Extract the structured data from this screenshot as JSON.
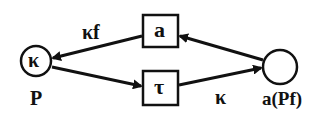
{
  "diagram": {
    "nodes": [
      {
        "id": "P",
        "shape": "circle",
        "inner_label": "κ",
        "outer_label": "P"
      },
      {
        "id": "a",
        "shape": "box",
        "inner_label": "a"
      },
      {
        "id": "tau",
        "shape": "box",
        "inner_label": "τ"
      },
      {
        "id": "aPf",
        "shape": "circle",
        "inner_label": "",
        "outer_label": "a(Pf)"
      }
    ],
    "edges": [
      {
        "from": "a",
        "to": "P",
        "label": "κf"
      },
      {
        "from": "P",
        "to": "tau",
        "label": ""
      },
      {
        "from": "tau",
        "to": "aPf",
        "label": "κ"
      },
      {
        "from": "aPf",
        "to": "a",
        "label": ""
      }
    ],
    "colors": {
      "stroke": "#111111",
      "background": "#ffffff"
    }
  }
}
